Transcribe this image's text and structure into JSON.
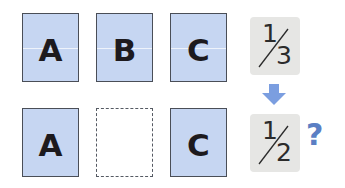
{
  "top_row": {
    "cards": [
      {
        "letter": "A"
      },
      {
        "letter": "B"
      },
      {
        "letter": "C"
      }
    ],
    "fraction": {
      "numerator": "1",
      "denominator": "3"
    }
  },
  "bottom_row": {
    "cards": [
      {
        "letter": "A"
      },
      {
        "letter": "",
        "empty": true
      },
      {
        "letter": "C"
      }
    ],
    "fraction": {
      "numerator": "1",
      "denominator": "2"
    },
    "question_mark": "?"
  },
  "arrow": {
    "direction": "down",
    "icon": "down-arrow-icon"
  },
  "colors": {
    "card_fill": "#c6d6f2",
    "card_border": "#4a4e57",
    "fraction_fill": "#e6e6e4",
    "accent_blue": "#5b7fc4",
    "arrow": "#7b9ee0"
  }
}
